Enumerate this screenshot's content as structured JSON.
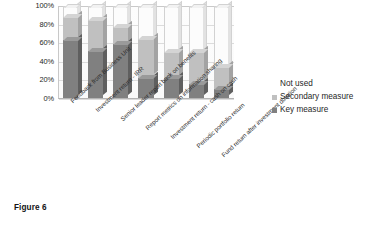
{
  "caption": "Figure 6",
  "legend": {
    "title": "",
    "position": "right",
    "items": [
      {
        "label": "Not used",
        "color": "#ffffff",
        "swatch": "none"
      },
      {
        "label": "Secondary measure",
        "color": "#c0c0c0",
        "swatch": "filled"
      },
      {
        "label": "Key measure",
        "color": "#808080",
        "swatch": "filled"
      }
    ]
  },
  "colors": {
    "key_measure": "#808080",
    "key_measure_side": "#5f5f5f",
    "key_measure_top": "#9a9a9a",
    "secondary_measure": "#c0c0c0",
    "secondary_measure_side": "#a3a3a3",
    "secondary_measure_top": "#d4d4d4",
    "not_used": "#fcfcfc",
    "gridline": "#dcdcdc",
    "axis": "#b4b4b4",
    "text": "#262626"
  },
  "chart_data": {
    "type": "bar",
    "stacked": true,
    "title": "",
    "xlabel": "",
    "ylabel": "",
    "ylim": [
      0,
      100
    ],
    "ytick_labels": [
      "100%",
      "80%",
      "60%",
      "40%",
      "20%",
      "0%"
    ],
    "ytick_values": [
      100,
      80,
      60,
      40,
      20,
      0
    ],
    "grid": true,
    "legend_position": "right",
    "categories": [
      "Feedback from Business Unit",
      "Investment return - IRR",
      "Senior leader report back on benefits",
      "Report metrics on information sharing",
      "Investment return - cash on cash",
      "Periodic portfolio return",
      "Fund return after investment duration"
    ],
    "series": [
      {
        "name": "Key measure",
        "color": "#808080",
        "values": [
          62,
          51,
          58,
          22,
          22,
          15,
          10
        ]
      },
      {
        "name": "Secondary measure",
        "color": "#c0c0c0",
        "values": [
          25,
          33,
          18,
          41,
          28,
          34,
          23
        ]
      },
      {
        "name": "Not used",
        "color": "#ffffff",
        "values": [
          13,
          16,
          24,
          37,
          50,
          51,
          67
        ]
      }
    ]
  }
}
